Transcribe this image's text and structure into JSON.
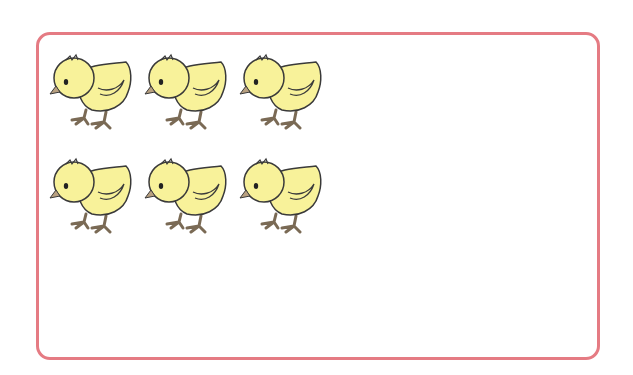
{
  "frame": {
    "border_color": "#e57b83"
  },
  "chicks": {
    "count": 6,
    "rows": 2,
    "per_row": 3,
    "body_color": "#f8f29a",
    "outline_color": "#3a3a3a",
    "beak_color": "#b8a080",
    "feet_color": "#9a8a70",
    "positions": [
      {
        "x": 48,
        "y": 48
      },
      {
        "x": 143,
        "y": 48
      },
      {
        "x": 238,
        "y": 48
      },
      {
        "x": 48,
        "y": 152
      },
      {
        "x": 143,
        "y": 152
      },
      {
        "x": 238,
        "y": 152
      }
    ]
  }
}
